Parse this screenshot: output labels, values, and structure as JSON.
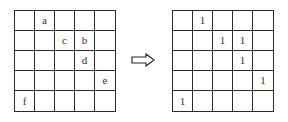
{
  "diagram": {
    "left_grid": {
      "rows": 5,
      "cols": 5,
      "cells": [
        [
          "",
          "a",
          "",
          "",
          ""
        ],
        [
          "",
          "",
          "c",
          "b",
          ""
        ],
        [
          "",
          "",
          "",
          "d",
          ""
        ],
        [
          "",
          "",
          "",
          "",
          "e"
        ],
        [
          "f",
          "",
          "",
          "",
          ""
        ]
      ]
    },
    "arrow": {
      "icon": "hollow-right-arrow-icon",
      "direction": "right"
    },
    "right_grid": {
      "rows": 5,
      "cols": 5,
      "cells": [
        [
          "",
          "1",
          "",
          "",
          ""
        ],
        [
          "",
          "",
          "1",
          "1",
          ""
        ],
        [
          "",
          "",
          "",
          "1",
          ""
        ],
        [
          "",
          "",
          "",
          "",
          "1"
        ],
        [
          "1",
          "",
          "",
          "",
          ""
        ]
      ]
    },
    "colors": {
      "line": "#2a2a2a",
      "text": "#333333",
      "background": "#ffffff"
    }
  }
}
